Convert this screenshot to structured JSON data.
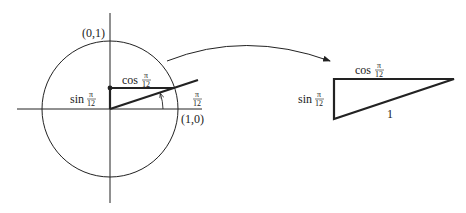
{
  "diagram": {
    "unit_circle": {
      "top_label": "(0,1)",
      "right_label": "(1,0)",
      "angle_label": {
        "num": "π",
        "den": "12"
      },
      "sin_label": {
        "fn": "sin",
        "num": "π",
        "den": "12"
      },
      "cos_label": {
        "fn": "cos",
        "num": "π",
        "den": "12"
      }
    },
    "triangle": {
      "top_label": {
        "fn": "cos",
        "num": "π",
        "den": "12"
      },
      "left_label": {
        "fn": "sin",
        "num": "π",
        "den": "12"
      },
      "hypotenuse_label": "1"
    },
    "colors": {
      "stroke": "#222222",
      "background": "#ffffff"
    }
  }
}
